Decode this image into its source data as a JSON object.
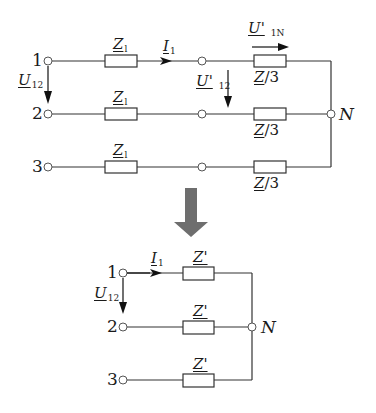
{
  "upper_circuit": {
    "terminals": [
      "1",
      "2",
      "3"
    ],
    "line_impedance": {
      "symbol": "Z",
      "subscript": "l"
    },
    "load_impedance": "Z/3",
    "load_impedance_parts": {
      "symbol": "Z",
      "rest": "/3"
    },
    "current": {
      "symbol": "I",
      "subscript": "1"
    },
    "voltage_line": {
      "symbol": "U",
      "subscript": "12"
    },
    "voltage_transformed_line": {
      "symbol": "U'",
      "subscript": "12"
    },
    "voltage_phase": {
      "symbol": "U'",
      "subscript": "1N"
    },
    "neutral": "N"
  },
  "transition_arrow": {
    "color": "#6e6e6e",
    "direction": "down"
  },
  "lower_circuit": {
    "terminals": [
      "1",
      "2",
      "3"
    ],
    "impedance": "Z'",
    "current": {
      "symbol": "I",
      "subscript": "1"
    },
    "voltage_line": {
      "symbol": "U",
      "subscript": "12"
    },
    "neutral": "N"
  },
  "colors": {
    "line": "#333333",
    "arrow": "#6e6e6e"
  }
}
